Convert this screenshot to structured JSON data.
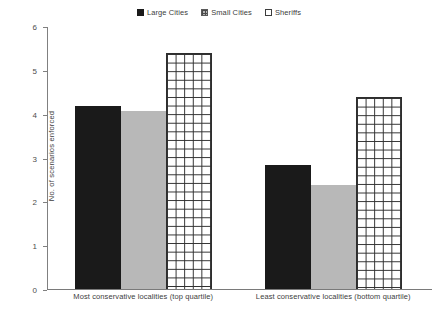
{
  "chart_data": {
    "type": "bar",
    "title": "",
    "xlabel": "",
    "ylabel": "No. of scenarios enforced",
    "ylim": [
      0,
      6
    ],
    "ytick_labels": [
      "6",
      "5",
      "4",
      "3",
      "2",
      "1",
      "0"
    ],
    "ytick_values": [
      6,
      5,
      4,
      3,
      2,
      1,
      0
    ],
    "grid": false,
    "legend_position": "top-center",
    "categories": [
      "Most conservative localities (top quartile)",
      "Least conservative localities (bottom quartile)"
    ],
    "series": [
      {
        "name": "Large Cities",
        "fill": "solid-black",
        "color": "#1a1a1a",
        "values": [
          4.17,
          2.83
        ]
      },
      {
        "name": "Small Cities",
        "fill": "solid-gray",
        "color": "#b8b8b8",
        "values": [
          4.06,
          2.38
        ]
      },
      {
        "name": "Sheriffs",
        "fill": "grid-hatch",
        "color": "#ffffff",
        "values": [
          5.38,
          4.38
        ]
      }
    ]
  },
  "legend": {
    "items": [
      {
        "label": "Large Cities",
        "swatch": "solid-dark-square-icon"
      },
      {
        "label": "Small Cities",
        "swatch": "gray-hatched-square-icon"
      },
      {
        "label": "Sheriffs",
        "swatch": "white-outline-square-icon"
      }
    ]
  },
  "axes": {
    "y_title": "No. of scenarios enforced",
    "y_ticks": [
      "6",
      "5",
      "4",
      "3",
      "2",
      "1",
      "0"
    ],
    "x_categories": [
      "Most conservative localities (top quartile)",
      "Least conservative localities (bottom quartile)"
    ]
  }
}
